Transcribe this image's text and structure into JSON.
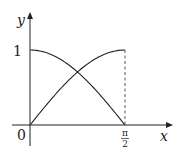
{
  "chart_data": {
    "type": "line",
    "title": "",
    "xlabel": "x",
    "ylabel": "y",
    "xlim": [
      0,
      1.5708
    ],
    "ylim": [
      0,
      1
    ],
    "x_ticks": [
      {
        "value": 0,
        "label": "0"
      },
      {
        "value": 1.5708,
        "label": "π/2"
      }
    ],
    "y_ticks": [
      {
        "value": 1,
        "label": "1"
      }
    ],
    "grid": false,
    "series": [
      {
        "name": "sin x",
        "function": "sin(x)",
        "x": [
          0,
          0.3927,
          0.7854,
          1.1781,
          1.5708
        ],
        "values": [
          0,
          0.3827,
          0.7071,
          0.9239,
          1
        ]
      },
      {
        "name": "cos x",
        "function": "cos(x)",
        "x": [
          0,
          0.3927,
          0.7854,
          1.1781,
          1.5708
        ],
        "values": [
          1,
          0.9239,
          0.7071,
          0.3827,
          0
        ]
      }
    ],
    "annotations": [
      {
        "type": "dashed-vertical-line",
        "x": 1.5708,
        "from_y": 0,
        "to_y": 1
      },
      {
        "type": "intersection",
        "x": 0.7854,
        "y": 0.7071
      }
    ]
  },
  "labels": {
    "y_axis": "y",
    "x_axis": "x",
    "origin": "0",
    "y_one": "1",
    "pi_num": "π",
    "pi_den": "2"
  }
}
